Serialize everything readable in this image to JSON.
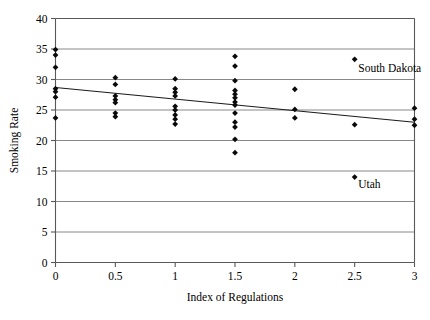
{
  "chart_data": {
    "type": "scatter",
    "title": "",
    "xlabel": "Index of Regulations",
    "ylabel": "Smoking Rate",
    "xlim": [
      0,
      3
    ],
    "ylim": [
      0,
      40
    ],
    "xticks": [
      0,
      0.5,
      1,
      1.5,
      2,
      2.5,
      3
    ],
    "xtick_labels": [
      "0",
      "0.5",
      "1",
      "1.5",
      "2",
      "2.5",
      "3"
    ],
    "yticks": [
      0,
      5,
      10,
      15,
      20,
      25,
      30,
      35,
      40
    ],
    "ytick_labels": [
      "0",
      "5",
      "10",
      "15",
      "20",
      "25",
      "30",
      "35",
      "40"
    ],
    "grid": "horizontal",
    "legend": "none",
    "marker": "diamond",
    "marker_color": "#0a0a0a",
    "points": [
      {
        "x": 0,
        "y": 34.9
      },
      {
        "x": 0,
        "y": 34.0
      },
      {
        "x": 0,
        "y": 32.0
      },
      {
        "x": 0,
        "y": 28.5
      },
      {
        "x": 0,
        "y": 28.0
      },
      {
        "x": 0,
        "y": 27.1
      },
      {
        "x": 0,
        "y": 23.7
      },
      {
        "x": 0.5,
        "y": 30.3
      },
      {
        "x": 0.5,
        "y": 29.2
      },
      {
        "x": 0.5,
        "y": 27.3
      },
      {
        "x": 0.5,
        "y": 26.7
      },
      {
        "x": 0.5,
        "y": 26.2
      },
      {
        "x": 0.5,
        "y": 24.5
      },
      {
        "x": 0.5,
        "y": 23.9
      },
      {
        "x": 1,
        "y": 30.1
      },
      {
        "x": 1,
        "y": 28.5
      },
      {
        "x": 1,
        "y": 27.9
      },
      {
        "x": 1,
        "y": 27.3
      },
      {
        "x": 1,
        "y": 25.6
      },
      {
        "x": 1,
        "y": 25.0
      },
      {
        "x": 1,
        "y": 24.2
      },
      {
        "x": 1,
        "y": 23.5
      },
      {
        "x": 1,
        "y": 22.7
      },
      {
        "x": 1.5,
        "y": 33.8
      },
      {
        "x": 1.5,
        "y": 32.2
      },
      {
        "x": 1.5,
        "y": 29.8
      },
      {
        "x": 1.5,
        "y": 28.2
      },
      {
        "x": 1.5,
        "y": 27.6
      },
      {
        "x": 1.5,
        "y": 27.0
      },
      {
        "x": 1.5,
        "y": 26.3
      },
      {
        "x": 1.5,
        "y": 25.8
      },
      {
        "x": 1.5,
        "y": 24.5
      },
      {
        "x": 1.5,
        "y": 23.0
      },
      {
        "x": 1.5,
        "y": 22.2
      },
      {
        "x": 1.5,
        "y": 20.2
      },
      {
        "x": 1.5,
        "y": 18.0
      },
      {
        "x": 2,
        "y": 28.4
      },
      {
        "x": 2,
        "y": 25.1
      },
      {
        "x": 2,
        "y": 23.7
      },
      {
        "x": 2.5,
        "y": 33.3
      },
      {
        "x": 2.5,
        "y": 22.6
      },
      {
        "x": 2.5,
        "y": 14.0
      },
      {
        "x": 3,
        "y": 25.3
      },
      {
        "x": 3,
        "y": 23.5
      },
      {
        "x": 3,
        "y": 22.5
      }
    ],
    "trend_line": {
      "x1": 0,
      "y1": 28.7,
      "x2": 3,
      "y2": 23.0
    },
    "annotations": [
      {
        "text": "South Dakota",
        "x": 2.53,
        "y": 31.3,
        "anchor": "start"
      },
      {
        "text": "Utah",
        "x": 2.53,
        "y": 12.2,
        "anchor": "start"
      }
    ]
  }
}
